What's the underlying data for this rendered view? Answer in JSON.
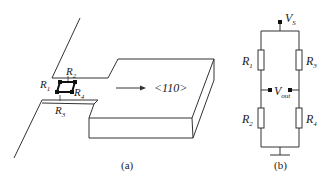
{
  "figure_a": {
    "caption": "(a)",
    "direction_label": "<110>",
    "resistors": [
      {
        "symbol": "R",
        "index": "1"
      },
      {
        "symbol": "R",
        "index": "2"
      },
      {
        "symbol": "R",
        "index": "3"
      },
      {
        "symbol": "R",
        "index": "4"
      }
    ]
  },
  "figure_b": {
    "caption": "(b)",
    "supply": {
      "symbol": "V",
      "sub": "S"
    },
    "output": {
      "symbol": "V",
      "sub": "out"
    },
    "resistors": [
      {
        "symbol": "R",
        "index": "1"
      },
      {
        "symbol": "R",
        "index": "2"
      },
      {
        "symbol": "R",
        "index": "3"
      },
      {
        "symbol": "R",
        "index": "4"
      }
    ]
  },
  "colors": {
    "stroke": "#333333",
    "background": "#ffffff"
  }
}
